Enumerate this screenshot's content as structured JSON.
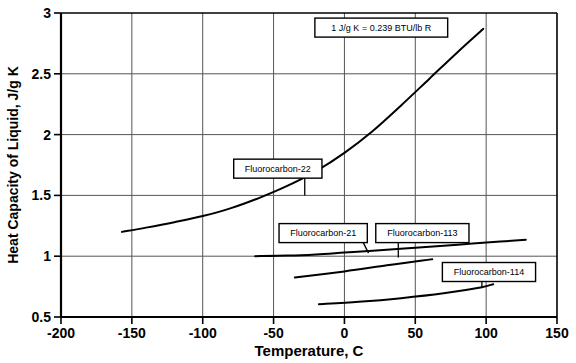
{
  "chart_data": {
    "type": "line",
    "title": "",
    "xlabel": "Temperature, C",
    "ylabel": "Heat Capacity of Liquid, J/g K",
    "xlim": [
      -200,
      150
    ],
    "ylim": [
      0.5,
      3
    ],
    "xticks": [
      "-200",
      "-150",
      "-100",
      "-50",
      "0",
      "50",
      "100",
      "150"
    ],
    "xtick_values": [
      -200,
      -150,
      -100,
      -50,
      0,
      50,
      100,
      150
    ],
    "yticks": [
      "0.5",
      "1",
      "1.5",
      "2",
      "2.5",
      "3"
    ],
    "ytick_values": [
      0.5,
      1,
      1.5,
      2,
      2.5,
      3
    ],
    "grid": true,
    "legend_position": "inline-callout-boxes",
    "line_color": "#000000",
    "grid_color": "#555555",
    "axis_color": "#000000",
    "annotations": [
      {
        "name": "unit-conversion-note",
        "text": "1 J/g K = 0.239 BTU/lb R",
        "x": 26,
        "y": 2.88
      }
    ],
    "series": [
      {
        "name": "Fluorocarbon-22",
        "label_text": "Fluorocarbon-22",
        "label_x": -47,
        "label_y": 1.72,
        "leader_to_x": -28,
        "leader_to_y": 1.5,
        "points": [
          [
            -157,
            1.2
          ],
          [
            -140,
            1.235
          ],
          [
            -120,
            1.28
          ],
          [
            -100,
            1.33
          ],
          [
            -80,
            1.395
          ],
          [
            -60,
            1.48
          ],
          [
            -40,
            1.58
          ],
          [
            -20,
            1.7
          ],
          [
            0,
            1.85
          ],
          [
            20,
            2.03
          ],
          [
            40,
            2.24
          ],
          [
            60,
            2.46
          ],
          [
            80,
            2.68
          ],
          [
            98,
            2.87
          ]
        ]
      },
      {
        "name": "Fluorocarbon-21",
        "label_text": "Fluorocarbon-21",
        "label_x": -15,
        "label_y": 1.19,
        "leader_to_x": 17,
        "leader_to_y": 1.025,
        "points": [
          [
            -63,
            1.0
          ],
          [
            -40,
            1.005
          ],
          [
            -20,
            1.015
          ],
          [
            0,
            1.03
          ],
          [
            20,
            1.045
          ],
          [
            50,
            1.07
          ],
          [
            80,
            1.095
          ],
          [
            110,
            1.12
          ],
          [
            128,
            1.135
          ]
        ]
      },
      {
        "name": "Fluorocarbon-113",
        "label_text": "Fluorocarbon-113",
        "label_x": 55,
        "label_y": 1.19,
        "leader_to_x": 38,
        "leader_to_y": 0.99,
        "points": [
          [
            -35,
            0.825
          ],
          [
            0,
            0.875
          ],
          [
            30,
            0.925
          ],
          [
            55,
            0.965
          ],
          [
            62,
            0.975
          ]
        ]
      },
      {
        "name": "Fluorocarbon-114",
        "label_text": "Fluorocarbon-114",
        "label_x": 102,
        "label_y": 0.87,
        "leader_to_x": 97,
        "leader_to_y": 0.745,
        "points": [
          [
            -18,
            0.605
          ],
          [
            10,
            0.625
          ],
          [
            40,
            0.655
          ],
          [
            70,
            0.695
          ],
          [
            97,
            0.745
          ],
          [
            105,
            0.77
          ]
        ]
      }
    ]
  }
}
